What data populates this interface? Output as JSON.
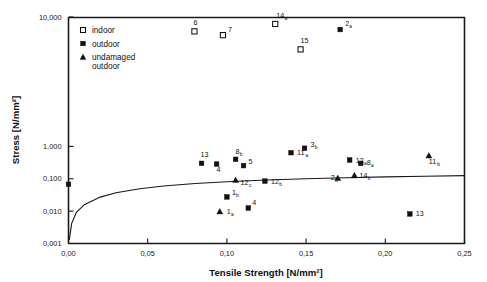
{
  "chart_data": {
    "type": "scatter",
    "title": "",
    "xlabel": "Tensile Strength [N/mm²]",
    "ylabel": "Stress [N/mm²]",
    "xlim": [
      0.0,
      0.25
    ],
    "ylim": [
      0.001,
      10000
    ],
    "yscale": "log",
    "xscale": "linear",
    "grid": false,
    "xticks": [
      0.0,
      0.05,
      0.1,
      0.15,
      0.2,
      0.25
    ],
    "xticklabels": [
      "0,00",
      "0,05",
      "0,10",
      "0,15",
      "0,20",
      "0,25"
    ],
    "yticks": [
      0.001,
      0.01,
      0.1,
      1.0,
      10000
    ],
    "yticklabels": [
      "0,001",
      "0,010",
      "0,100",
      "1,000",
      "10,000"
    ],
    "legend_position": "upper-left-inside",
    "series": [
      {
        "name": "indoor",
        "marker": "open-square",
        "points": [
          {
            "label": "6",
            "sub": "",
            "x": 0.0795,
            "y": 3600
          },
          {
            "label": "7",
            "sub": "",
            "x": 0.0975,
            "y": 2750
          },
          {
            "label": "14",
            "sub": "a",
            "x": 0.1305,
            "y": 6100
          },
          {
            "label": "15",
            "sub": "",
            "x": 0.1465,
            "y": 1000
          }
        ]
      },
      {
        "name": "outdoor",
        "marker": "filled-square",
        "points": [
          {
            "label": "",
            "sub": "",
            "x": 0.0,
            "y": 0.068
          },
          {
            "label": "13",
            "sub": "",
            "x": 0.084,
            "y": 0.3
          },
          {
            "label": "4",
            "sub": "",
            "x": 0.0935,
            "y": 0.285
          },
          {
            "label": "8",
            "sub": "b",
            "x": 0.1055,
            "y": 0.4
          },
          {
            "label": "5",
            "sub": "",
            "x": 0.1105,
            "y": 0.255
          },
          {
            "label": "11",
            "sub": "a",
            "x": 0.1405,
            "y": 0.64
          },
          {
            "label": "3",
            "sub": "b",
            "x": 0.149,
            "y": 0.88
          },
          {
            "label": "2",
            "sub": "a",
            "x": 0.1715,
            "y": 4100
          },
          {
            "label": "12",
            "sub": "b",
            "x": 0.124,
            "y": 0.085
          },
          {
            "label": "12",
            "sub": "a",
            "x": 0.1775,
            "y": 0.38
          },
          {
            "label": "8",
            "sub": "a",
            "x": 0.1845,
            "y": 0.3
          },
          {
            "label": "1",
            "sub": "b",
            "x": 0.1,
            "y": 0.0275
          },
          {
            "label": "4",
            "sub": "",
            "x": 0.1135,
            "y": 0.0125
          },
          {
            "label": "13",
            "sub": "",
            "x": 0.2155,
            "y": 0.0082
          }
        ]
      },
      {
        "name": "undamaged outdoor",
        "marker": "filled-triangle",
        "points": [
          {
            "label": "12",
            "sub": "c",
            "x": 0.1055,
            "y": 0.092
          },
          {
            "label": "14",
            "sub": "b",
            "x": 0.1805,
            "y": 0.128
          },
          {
            "label": "2",
            "sub": "b",
            "x": 0.17,
            "y": 0.105
          },
          {
            "label": "11",
            "sub": "b",
            "x": 0.2275,
            "y": 0.52
          },
          {
            "label": "1",
            "sub": "a",
            "x": 0.0955,
            "y": 0.0098
          }
        ]
      }
    ],
    "fit_curve": {
      "description": "power-law envelope rising from origin",
      "x": [
        0.0005,
        0.002,
        0.005,
        0.01,
        0.02,
        0.03,
        0.045,
        0.06,
        0.08,
        0.1,
        0.125,
        0.15,
        0.175,
        0.2,
        0.225,
        0.25
      ],
      "y": [
        0.0013,
        0.0042,
        0.0092,
        0.0158,
        0.0272,
        0.037,
        0.0494,
        0.06,
        0.0715,
        0.081,
        0.0915,
        0.1,
        0.1075,
        0.114,
        0.12,
        0.1255
      ]
    }
  },
  "legend": {
    "entries": [
      {
        "label": "indoor",
        "marker": "open-square"
      },
      {
        "label": "outdoor",
        "marker": "filled-square"
      },
      {
        "label": "undamaged\noutdoor",
        "marker": "filled-triangle",
        "line1": "undamaged",
        "line2": "outdoor"
      }
    ],
    "indoor_label": "indoor",
    "outdoor_label": "outdoor",
    "undamaged_label_line1": "undamaged",
    "undamaged_label_line2": "outdoor"
  },
  "colors": {
    "axis": "#1a1a1a",
    "marker_fill": "#111111",
    "marker_open_fill": "#ffffff",
    "background": "#ffffff",
    "curve": "#1a1a1a"
  }
}
